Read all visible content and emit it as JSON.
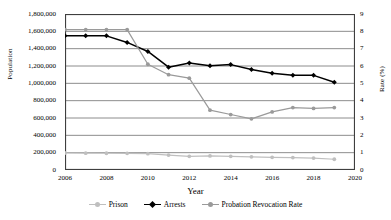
{
  "chart_data": {
    "type": "line",
    "title": "",
    "xlabel": "Year",
    "ylabel": "Population",
    "y2label": "Rate (%)",
    "grid": true,
    "legend_position": "bottom",
    "xlim": [
      2006,
      2020
    ],
    "xticks": [
      "2006",
      "2008",
      "2010",
      "2012",
      "2014",
      "2016",
      "2018",
      "2020"
    ],
    "xtick_values": [
      2006,
      2008,
      2010,
      2012,
      2014,
      2016,
      2018,
      2020
    ],
    "ylim": [
      0,
      1800000
    ],
    "yticks": [
      "0",
      "200,000",
      "400,000",
      "600,000",
      "800,000",
      "1,000,000",
      "1,200,000",
      "1,400,000",
      "1,600,000",
      "1,800,000"
    ],
    "ytick_values": [
      0,
      200000,
      400000,
      600000,
      800000,
      1000000,
      1200000,
      1400000,
      1600000,
      1800000
    ],
    "y2lim": [
      0,
      9
    ],
    "y2ticks": [
      "0",
      "1",
      "2",
      "3",
      "4",
      "5",
      "6",
      "7",
      "8",
      "9"
    ],
    "y2tick_values": [
      0,
      1,
      2,
      3,
      4,
      5,
      6,
      7,
      8,
      9
    ],
    "x": [
      2006,
      2007,
      2008,
      2009,
      2010,
      2011,
      2012,
      2013,
      2014,
      2015,
      2016,
      2017,
      2018,
      2019
    ],
    "series": [
      {
        "name": "Prison",
        "axis": "left",
        "color": "#bfbfbf",
        "marker": "circle",
        "values": [
          196000,
          194000,
          193000,
          192000,
          188000,
          172000,
          158000,
          162000,
          158000,
          152000,
          146000,
          143000,
          138000,
          124000
        ]
      },
      {
        "name": "Arrests",
        "axis": "left",
        "color": "#000000",
        "marker": "diamond",
        "values": [
          1548000,
          1550000,
          1548000,
          1472000,
          1368000,
          1186000,
          1234000,
          1204000,
          1216000,
          1160000,
          1116000,
          1092000,
          1092000,
          1012000
        ]
      },
      {
        "name": "Probation Revocation Rate",
        "axis": "right",
        "color": "#9a9a9a",
        "marker": "circle",
        "values": [
          8.1,
          8.1,
          8.1,
          8.1,
          6.1,
          5.5,
          5.3,
          3.45,
          3.2,
          2.95,
          3.35,
          3.6,
          3.55,
          3.6
        ]
      }
    ]
  },
  "legend": {
    "items": [
      {
        "label": "Prison",
        "color": "#bfbfbf",
        "marker": "circle"
      },
      {
        "label": "Arrests",
        "color": "#000000",
        "marker": "diamond"
      },
      {
        "label": "Probation Revocation Rate",
        "color": "#9a9a9a",
        "marker": "circle"
      }
    ]
  },
  "colors": {
    "axis": "#3f3f3f",
    "grid": "#808080",
    "background": "#ffffff",
    "prison": "#bfbfbf",
    "arrests": "#000000",
    "probation": "#9a9a9a"
  }
}
